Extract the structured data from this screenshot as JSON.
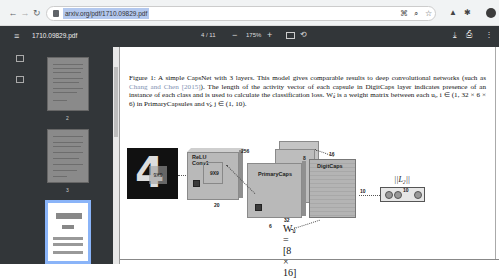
{
  "browser": {
    "back_icon": "←",
    "forward_icon": "→",
    "reload_icon": "↻",
    "url": "arxiv.org/pdf/1710.09829.pdf",
    "omnibox_icons": [
      "⌘",
      "⌕",
      "☆"
    ],
    "extension_icons": [
      "▲",
      "✱"
    ]
  },
  "pdf_toolbar": {
    "menu_icon": "≡",
    "file_name": "1710.09829.pdf",
    "page_indicator": "4 / 11",
    "zoom_out": "−",
    "zoom_level": "175%",
    "zoom_in": "+",
    "rotate_icon": "⟲",
    "download_icon": "⤓",
    "print_icon": "⎙",
    "more_icon": "⋮"
  },
  "sidebar": {
    "thumbnails": [
      {
        "page": "2",
        "active": false
      },
      {
        "page": "3",
        "active": false
      },
      {
        "page": "4",
        "active": true
      }
    ]
  },
  "document": {
    "caption_lead": "Figure 1: A simple CapsNet with 3 layers. This model gives comparable results to deep convolutional networks (such as ",
    "caption_cite": "Chang and Chen [2015]",
    "caption_rest": "). The length of the activity vector of each capsule in DigitCaps layer indicates presence of an instance of each class and is used to calculate the classification loss. Wᵢⱼ is a weight matrix between each uᵢ, i ∈ (1, 32 × 6 × 6) in PrimaryCapsules and vⱼ, j ∈ (1, 10).",
    "figure": {
      "input_patch_label": "9X9",
      "conv1_label": "ReLU Conv1",
      "conv1_kernel": "9X9",
      "conv1_depth": "256",
      "conv1_width": "20",
      "primary_label": "PrimaryCaps",
      "primary_depth": "8",
      "primary_width": "6",
      "primary_count": "32",
      "digitcaps_label": "DigitCaps",
      "digitcaps_dim": "16",
      "digitcaps_out": "10",
      "l2_label": "||L₂||",
      "l2_count": "10",
      "weight_eq": "Wᵢⱼ = [8 × 16]"
    }
  }
}
